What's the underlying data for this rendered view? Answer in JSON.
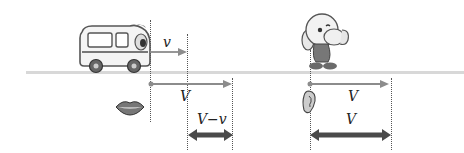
{
  "diagram": {
    "labels": {
      "source_speed": "v",
      "wave_speed_source": "V",
      "relative_speed_source": "V−v",
      "wave_speed_listener": "V",
      "relative_speed_listener": "V"
    },
    "icons": {
      "source": "bus-icon",
      "observer": "cartoon-person-cupping-ear-icon",
      "emitter": "mouth-icon",
      "receiver": "ear-icon"
    },
    "colors": {
      "ground": "#d8d8d8",
      "thin_arrow": "#8c8c8c",
      "thick_arrow": "#4a4a4a",
      "dotted_line": "#555555"
    }
  }
}
